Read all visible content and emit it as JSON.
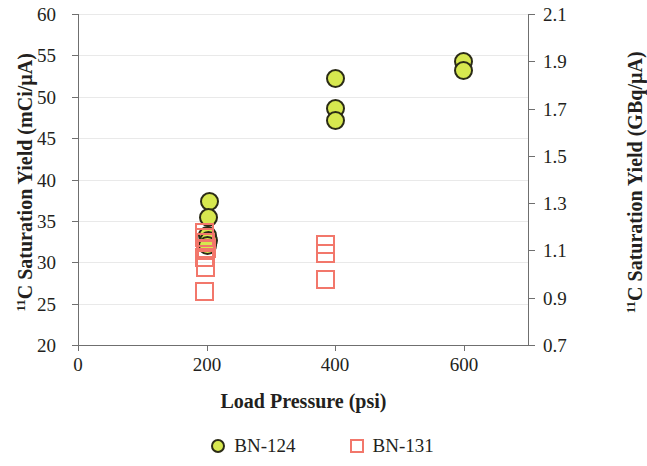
{
  "chart_data": {
    "type": "scatter",
    "title": "",
    "xlabel": "Load Pressure (psi)",
    "ylabel": "¹¹C Saturation Yield (mCi/µA)",
    "ylabel_right": "¹¹C Saturation Yield (GBq/µA)",
    "xlim": [
      0,
      700
    ],
    "ylim": [
      20,
      60
    ],
    "ylim_right": [
      0.7,
      2.1
    ],
    "xticks": [
      0,
      200,
      400,
      600
    ],
    "xtick_labels": [
      "0",
      "200",
      "400",
      "600"
    ],
    "yticks": [
      20,
      25,
      30,
      35,
      40,
      45,
      50,
      55,
      60
    ],
    "ytick_labels": [
      "20",
      "25",
      "30",
      "35",
      "40",
      "45",
      "50",
      "55",
      "60"
    ],
    "yticks_right": [
      0.7,
      0.9,
      1.1,
      1.3,
      1.5,
      1.7,
      1.9,
      2.1
    ],
    "ytick_labels_right": [
      "0.7",
      "0.9",
      "1.1",
      "1.3",
      "1.5",
      "1.7",
      "1.9",
      "2.1"
    ],
    "grid": "horizontal",
    "legend_position": "bottom",
    "series": [
      {
        "name": "BN-124",
        "marker": "circle",
        "fill_color": "#d7e84f",
        "edge_color": "#2b2b16",
        "points": [
          {
            "x": 205,
            "y": 37.3
          },
          {
            "x": 203,
            "y": 35.4
          },
          {
            "x": 202,
            "y": 33.2
          },
          {
            "x": 203,
            "y": 32.6
          },
          {
            "x": 201,
            "y": 32.0
          },
          {
            "x": 400,
            "y": 52.2
          },
          {
            "x": 400,
            "y": 48.6
          },
          {
            "x": 400,
            "y": 47.1
          },
          {
            "x": 600,
            "y": 54.2
          },
          {
            "x": 600,
            "y": 53.2
          }
        ]
      },
      {
        "name": "BN-131",
        "marker": "square",
        "fill_color": "none",
        "edge_color": "#f2776b",
        "points": [
          {
            "x": 197,
            "y": 33.6
          },
          {
            "x": 197,
            "y": 33.0
          },
          {
            "x": 199,
            "y": 32.4
          },
          {
            "x": 200,
            "y": 31.7
          },
          {
            "x": 196,
            "y": 30.6
          },
          {
            "x": 198,
            "y": 29.4
          },
          {
            "x": 196,
            "y": 26.5
          },
          {
            "x": 385,
            "y": 32.1
          },
          {
            "x": 385,
            "y": 31.1
          },
          {
            "x": 385,
            "y": 27.9
          }
        ]
      }
    ]
  },
  "legend": {
    "items": [
      {
        "label": "BN-124",
        "marker": "circle-marker-icon"
      },
      {
        "label": "BN-131",
        "marker": "square-marker-icon"
      }
    ]
  }
}
